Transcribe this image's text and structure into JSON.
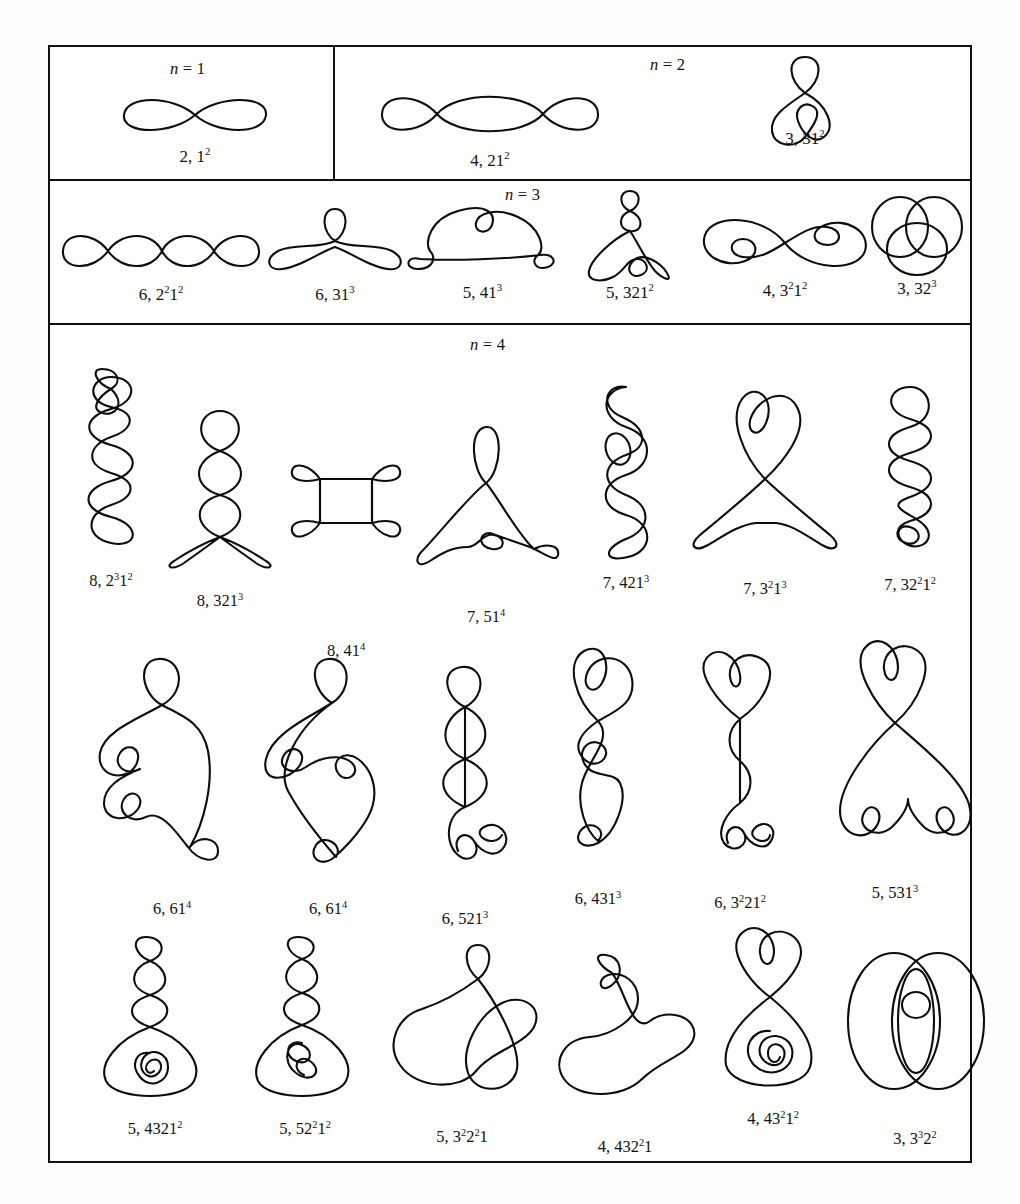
{
  "figure": {
    "kind": "table-of-closed-curve-diagrams",
    "stroke_color": "#0d0d0d",
    "background_color": "#fdfdfb",
    "border_color": "#111111"
  },
  "sections": [
    {
      "id": "n1",
      "title_var": "n",
      "title_eq": "=",
      "title_val": "1",
      "title": "n = 1",
      "items": [
        {
          "label_plain": "2, 1^2",
          "coef": "2,",
          "base": "1",
          "exp": "2",
          "name": "curve-2-1sq"
        }
      ]
    },
    {
      "id": "n2",
      "title_var": "n",
      "title_eq": "=",
      "title_val": "2",
      "title": "n = 2",
      "items": [
        {
          "label_plain": "4, 21^2",
          "coef": "4,",
          "base": "21",
          "exp": "2",
          "name": "curve-4-21sq"
        },
        {
          "label_plain": "3, 31^2",
          "coef": "3,",
          "base": "31",
          "exp": "2",
          "name": "curve-3-31sq"
        }
      ]
    },
    {
      "id": "n3",
      "title_var": "n",
      "title_eq": "=",
      "title_val": "3",
      "title": "n = 3",
      "items": [
        {
          "label_plain": "6, 2^2 1^2",
          "name": "curve-6-2sq1sq"
        },
        {
          "label_plain": "6, 31^3",
          "name": "curve-6-31cu"
        },
        {
          "label_plain": "5, 41^3",
          "name": "curve-5-41cu"
        },
        {
          "label_plain": "5, 321^2",
          "name": "curve-5-321sq"
        },
        {
          "label_plain": "4, 3^2 1^2",
          "name": "curve-4-3sq1sq"
        },
        {
          "label_plain": "3, 32^3",
          "name": "curve-3-32cu"
        }
      ]
    },
    {
      "id": "n4",
      "title_var": "n",
      "title_eq": "=",
      "title_val": "4",
      "title": "n = 4",
      "rows": [
        [
          {
            "label_plain": "8, 2^3 1^2",
            "name": "curve-8-2cu1sq"
          },
          {
            "label_plain": "8, 321^3",
            "name": "curve-8-321cu"
          },
          {
            "label_plain": "8, 41^4",
            "name": "curve-8-41q"
          },
          {
            "label_plain": "7, 51^4",
            "name": "curve-7-51q"
          },
          {
            "label_plain": "7, 421^3",
            "name": "curve-7-421cu"
          },
          {
            "label_plain": "7, 3^2 1^3",
            "name": "curve-7-3sq1cu"
          },
          {
            "label_plain": "7, 32^2 1^2",
            "name": "curve-7-32sq1sq"
          }
        ],
        [
          {
            "label_plain": "6, 61^4",
            "name": "curve-6-61q-a"
          },
          {
            "label_plain": "6, 61^4",
            "name": "curve-6-61q-b"
          },
          {
            "label_plain": "6, 521^3",
            "name": "curve-6-521cu"
          },
          {
            "label_plain": "6, 431^3",
            "name": "curve-6-431cu"
          },
          {
            "label_plain": "6, 3^2 21^2",
            "name": "curve-6-3sq21sq"
          },
          {
            "label_plain": "5, 531^3",
            "name": "curve-5-531cu"
          }
        ],
        [
          {
            "label_plain": "5, 4321^2",
            "name": "curve-5-4321sq"
          },
          {
            "label_plain": "5, 52^2 1^2",
            "name": "curve-5-52sq1sq"
          },
          {
            "label_plain": "5, 3^2 2^2 1",
            "name": "curve-5-3sq2sq1"
          },
          {
            "label_plain": "4, 432^2 1",
            "name": "curve-4-432sq1"
          },
          {
            "label_plain": "4, 43^2 1^2",
            "name": "curve-4-43sq1sq"
          },
          {
            "label_plain": "3, 3^3 2^2",
            "name": "curve-3-3cu2sq"
          }
        ]
      ]
    }
  ],
  "labels": {
    "n1_0": "2, 1",
    "n2_0": "4, 21",
    "n2_1": "3, 31",
    "n3_0": "6, 2",
    "n3_1": "6, 31",
    "n3_2": "5, 41",
    "n3_3": "5, 321",
    "n3_4": "4, 3",
    "n3_5": "3, 32"
  }
}
